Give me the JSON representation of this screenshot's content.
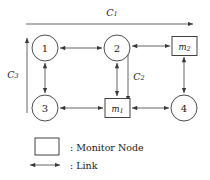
{
  "figure": {
    "type": "network-topology-diagram",
    "nodes": [
      {
        "id": "n1",
        "label": "1",
        "shape": "circle",
        "cx": 45,
        "cy": 48,
        "r": 13
      },
      {
        "id": "n2",
        "label": "2",
        "shape": "circle",
        "cx": 117,
        "cy": 48,
        "r": 13
      },
      {
        "id": "n3",
        "label": "3",
        "shape": "circle",
        "cx": 45,
        "cy": 108,
        "r": 13
      },
      {
        "id": "n4",
        "label": "4",
        "shape": "circle",
        "cx": 184,
        "cy": 108,
        "r": 13
      }
    ],
    "monitors": [
      {
        "id": "m1",
        "label": "m",
        "subscript": "1",
        "shape": "rect",
        "x": 105,
        "y": 98,
        "w": 25,
        "h": 19
      },
      {
        "id": "m2",
        "label": "m",
        "subscript": "2",
        "shape": "rect",
        "x": 172,
        "y": 36,
        "w": 25,
        "h": 19
      }
    ],
    "cycles": [
      {
        "id": "c1",
        "label": "C",
        "subscript": "1",
        "label_x": 112,
        "label_y": 12
      },
      {
        "id": "c2",
        "label": "C",
        "subscript": "2",
        "label_x": 139,
        "label_y": 76
      },
      {
        "id": "c3",
        "label": "C",
        "subscript": "3",
        "label_x": 13,
        "label_y": 74
      }
    ],
    "links": [
      {
        "from": "n1",
        "to": "n2",
        "style": "bidirectional"
      },
      {
        "from": "n2",
        "to": "m2",
        "style": "bidirectional"
      },
      {
        "from": "n1",
        "to": "n3",
        "style": "bidirectional"
      },
      {
        "from": "n2",
        "to": "m1",
        "style": "bidirectional"
      },
      {
        "from": "m2",
        "to": "n4",
        "style": "bidirectional"
      },
      {
        "from": "n3",
        "to": "m1",
        "style": "bidirectional"
      },
      {
        "from": "m1",
        "to": "n4",
        "style": "bidirectional"
      }
    ]
  },
  "legend": {
    "items": [
      {
        "id": "legend-monitor",
        "symbol": "rect",
        "text": ": Monitor Node"
      },
      {
        "id": "legend-link",
        "symbol": "double-arrow",
        "text": ": Link"
      }
    ]
  }
}
